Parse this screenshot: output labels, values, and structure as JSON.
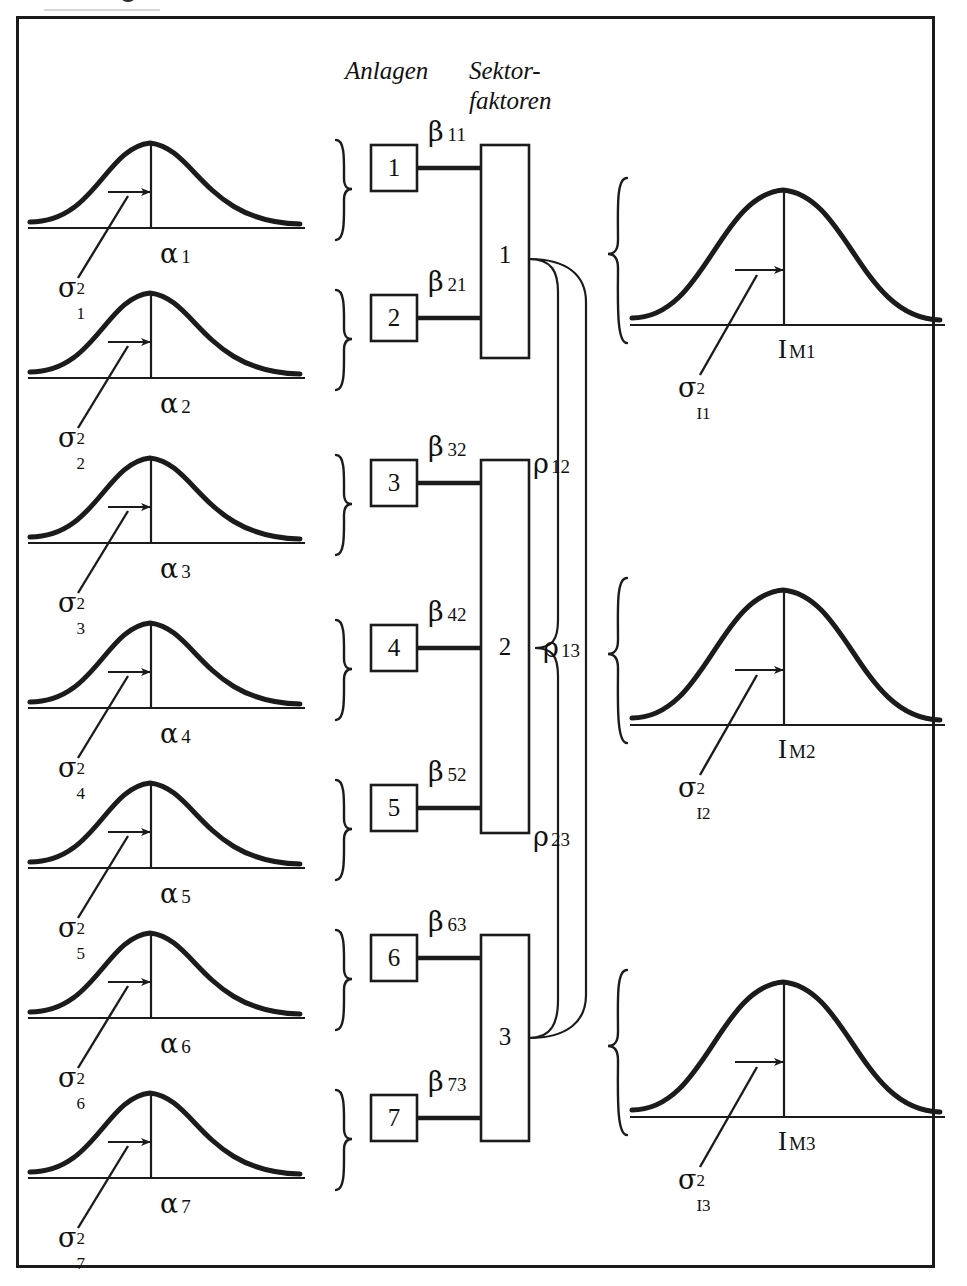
{
  "diagram": {
    "title_absent": true,
    "headers": {
      "plants": "Anlagen",
      "sector_factors_line1": "Sektor-",
      "sector_factors_line2": "faktoren"
    },
    "greek": {
      "sigma": "σ",
      "alpha": "α",
      "beta": "β",
      "rho": "ρ",
      "two": "2"
    },
    "plant_curves": [
      {
        "mean_label_base": "α",
        "mean_label_sub": "1",
        "var_base": "σ",
        "var_sup": "2",
        "var_sub": "1"
      },
      {
        "mean_label_base": "α",
        "mean_label_sub": "2",
        "var_base": "σ",
        "var_sup": "2",
        "var_sub": "2"
      },
      {
        "mean_label_base": "α",
        "mean_label_sub": "3",
        "var_base": "σ",
        "var_sup": "2",
        "var_sub": "3"
      },
      {
        "mean_label_base": "α",
        "mean_label_sub": "4",
        "var_base": "σ",
        "var_sup": "2",
        "var_sub": "4"
      },
      {
        "mean_label_base": "α",
        "mean_label_sub": "5",
        "var_base": "σ",
        "var_sup": "2",
        "var_sub": "5"
      },
      {
        "mean_label_base": "α",
        "mean_label_sub": "6",
        "var_base": "σ",
        "var_sup": "2",
        "var_sub": "6"
      },
      {
        "mean_label_base": "α",
        "mean_label_sub": "7",
        "var_base": "σ",
        "var_sup": "2",
        "var_sub": "7"
      }
    ],
    "plant_boxes": [
      {
        "label": "1"
      },
      {
        "label": "2"
      },
      {
        "label": "3"
      },
      {
        "label": "4"
      },
      {
        "label": "5"
      },
      {
        "label": "6"
      },
      {
        "label": "7"
      }
    ],
    "beta_links": [
      {
        "base": "β",
        "sub": "11",
        "from_plant": "1",
        "to_sector": "1"
      },
      {
        "base": "β",
        "sub": "21",
        "from_plant": "2",
        "to_sector": "1"
      },
      {
        "base": "β",
        "sub": "32",
        "from_plant": "3",
        "to_sector": "2"
      },
      {
        "base": "β",
        "sub": "42",
        "from_plant": "4",
        "to_sector": "2"
      },
      {
        "base": "β",
        "sub": "52",
        "from_plant": "5",
        "to_sector": "2"
      },
      {
        "base": "β",
        "sub": "63",
        "from_plant": "6",
        "to_sector": "3"
      },
      {
        "base": "β",
        "sub": "73",
        "from_plant": "7",
        "to_sector": "3"
      }
    ],
    "sector_boxes": [
      {
        "label": "1"
      },
      {
        "label": "2"
      },
      {
        "label": "3"
      }
    ],
    "rho_links": [
      {
        "base": "ρ",
        "sub": "12",
        "between": "1-2"
      },
      {
        "base": "ρ",
        "sub": "13",
        "between": "1-3"
      },
      {
        "base": "ρ",
        "sub": "23",
        "between": "2-3"
      }
    ],
    "index_curves": [
      {
        "mean_base": "I",
        "mean_sub": "M1",
        "var_base": "σ",
        "var_sup": "2",
        "var_sub": "I1"
      },
      {
        "mean_base": "I",
        "mean_sub": "M2",
        "var_base": "σ",
        "var_sup": "2",
        "var_sub": "I2"
      },
      {
        "mean_base": "I",
        "mean_sub": "M3",
        "var_base": "σ",
        "var_sup": "2",
        "var_sub": "I3"
      }
    ],
    "colors": {
      "ink": "#1b1b1b",
      "background": "#ffffff",
      "frame": "#1b1b1b"
    }
  }
}
